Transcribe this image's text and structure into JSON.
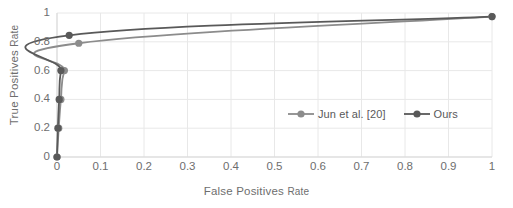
{
  "chart_data": {
    "type": "line",
    "title": "",
    "xlabel": "False Positives Rate",
    "ylabel": "True Positives Rate",
    "xlim": [
      0,
      1
    ],
    "ylim": [
      0,
      1
    ],
    "grid": true,
    "legend_position": "inside-bottom-right",
    "xticks": [
      "0",
      "0.1",
      "0.2",
      "0.3",
      "0.4",
      "0.5",
      "0.6",
      "0.7",
      "0.8",
      "0.9",
      "1"
    ],
    "xtick_values": [
      0,
      0.1,
      0.2,
      0.3,
      0.4,
      0.5,
      0.6,
      0.7,
      0.8,
      0.9,
      1
    ],
    "yticks": [
      "0",
      "0.2",
      "0.4",
      "0.6",
      "0.8",
      "1"
    ],
    "ytick_values": [
      0,
      0.2,
      0.4,
      0.6,
      0.8,
      1
    ],
    "series": [
      {
        "name": "Jun et al. [20]",
        "color": "#8c8c8c",
        "marker": "circle",
        "x": [
          0.0,
          0.004,
          0.009,
          0.017,
          0.05,
          1.0
        ],
        "y": [
          0.0,
          0.2,
          0.4,
          0.6,
          0.79,
          0.975
        ]
      },
      {
        "name": "Ours",
        "color": "#595959",
        "marker": "circle",
        "x": [
          0.0,
          0.002,
          0.005,
          0.009,
          0.028,
          1.0
        ],
        "y": [
          0.0,
          0.2,
          0.4,
          0.6,
          0.845,
          0.975
        ]
      }
    ]
  },
  "legend": {
    "entries": [
      {
        "label": "Jun et al. [20]",
        "color": "#8c8c8c"
      },
      {
        "label": "Ours",
        "color": "#595959"
      }
    ]
  },
  "axes": {
    "x_title_main": "False Positives",
    "x_title_suffix": "Rate",
    "y_title_main": "True Positives",
    "y_title_suffix": "Rate"
  },
  "style": {
    "grid_color": "#e8e8e8",
    "axis_color": "#d9d9d9",
    "text_color": "#6e6e6e",
    "background": "#ffffff"
  }
}
